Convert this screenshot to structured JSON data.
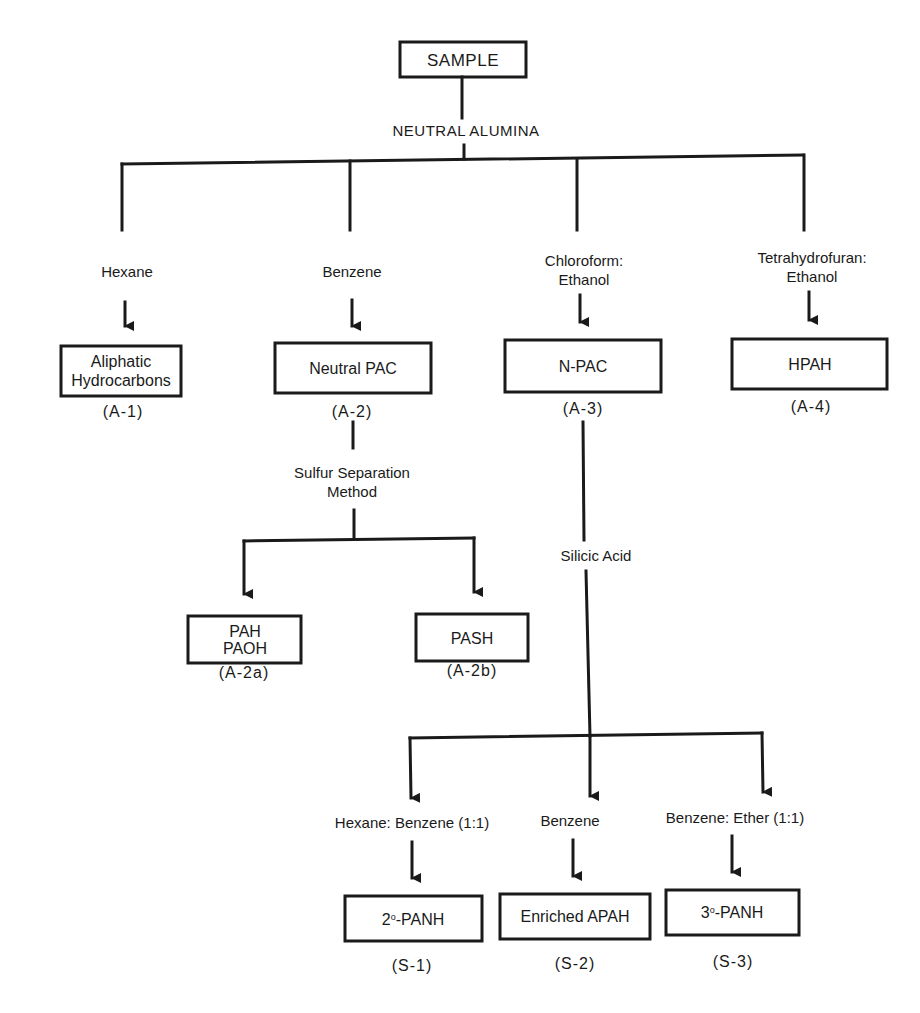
{
  "root": {
    "label": "SAMPLE"
  },
  "column1": {
    "label": "NEUTRAL ALUMINA",
    "eluents": [
      {
        "line1": "Hexane",
        "line2": ""
      },
      {
        "line1": "Benzene",
        "line2": ""
      },
      {
        "line1": "Chloroform:",
        "line2": "Ethanol"
      },
      {
        "line1": "Tetrahydrofuran:",
        "line2": "Ethanol"
      }
    ],
    "fractions": [
      {
        "line1": "Aliphatic",
        "line2": "Hydrocarbons",
        "code": "(A-1)"
      },
      {
        "line1": "Neutral PAC",
        "line2": "",
        "code": "(A-2)"
      },
      {
        "line1": "N-PAC",
        "line2": "",
        "code": "(A-3)"
      },
      {
        "line1": "HPAH",
        "line2": "",
        "code": "(A-4)"
      }
    ]
  },
  "sulfur_separation": {
    "line1": "Sulfur Separation",
    "line2": "Method",
    "fractions": [
      {
        "line1": "PAH",
        "line2": "PAOH",
        "code": "(A-2a)"
      },
      {
        "line1": "PASH",
        "line2": "",
        "code": "(A-2b)"
      }
    ]
  },
  "silicic_acid": {
    "label": "Silicic Acid",
    "eluents": [
      {
        "label": "Hexane: Benzene (1:1)"
      },
      {
        "label": "Benzene"
      },
      {
        "label": "Benzene: Ether (1:1)"
      }
    ],
    "fractions": [
      {
        "prefix": "2",
        "sup": "o",
        "suffix": "-PANH",
        "code": "(S-1)"
      },
      {
        "prefix": "Enriched APAH",
        "sup": "",
        "suffix": "",
        "code": "(S-2)"
      },
      {
        "prefix": "3",
        "sup": "o",
        "suffix": "-PANH",
        "code": "(S-3)"
      }
    ]
  }
}
